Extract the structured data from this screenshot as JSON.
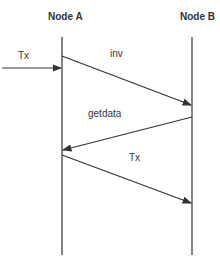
{
  "diagram": {
    "type": "sequence",
    "nodes": [
      {
        "label": "Node A"
      },
      {
        "label": "Node B"
      }
    ],
    "messages": [
      {
        "label": "Tx",
        "from": "external",
        "to": "Node A"
      },
      {
        "label": "inv",
        "from": "Node A",
        "to": "Node B"
      },
      {
        "label": "getdata",
        "from": "Node B",
        "to": "Node A"
      },
      {
        "label": "Tx",
        "from": "Node A",
        "to": "Node B"
      }
    ]
  },
  "colors": {
    "line": "#333333",
    "text": "#333333",
    "background": "#ffffff"
  }
}
